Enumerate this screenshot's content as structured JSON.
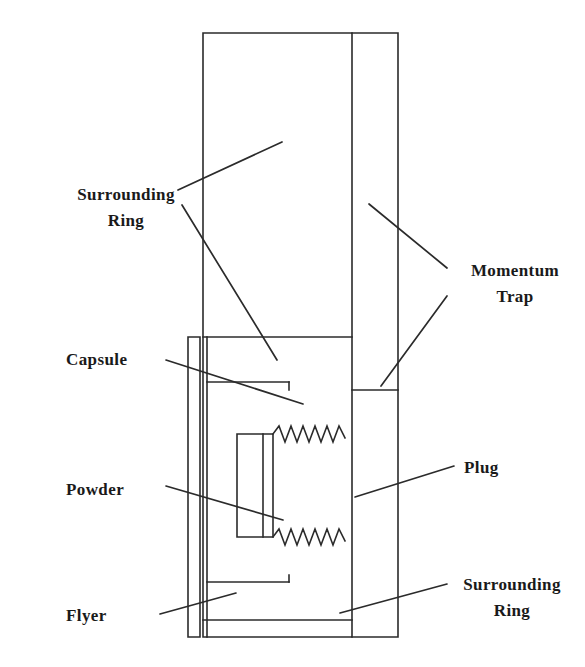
{
  "figure": {
    "background_color": "#ffffff",
    "line_color": "#2b2b2b",
    "text_color": "#1a1a1a",
    "width": 585,
    "height": 667
  },
  "labels": [
    {
      "id": "surrounding-ring-top",
      "line1": "Surrounding",
      "line2": "Ring",
      "x": 68,
      "y": 186
    },
    {
      "id": "momentum-trap",
      "line1": "Momentum",
      "line2": "Trap",
      "x": 455,
      "y": 262
    },
    {
      "id": "capsule",
      "line1": "Capsule",
      "line2": "",
      "x": 68,
      "y": 352
    },
    {
      "id": "powder",
      "line1": "Powder",
      "line2": "",
      "x": 68,
      "y": 482
    },
    {
      "id": "plug",
      "line1": "Plug",
      "line2": "",
      "x": 464,
      "y": 468
    },
    {
      "id": "surrounding-ring-bottom",
      "line1": "Surrounding",
      "line2": "Ring",
      "x": 455,
      "y": 580
    },
    {
      "id": "flyer",
      "line1": "Flyer",
      "line2": "",
      "x": 68,
      "y": 612
    }
  ],
  "parts": [
    {
      "id": "surrounding-ring-body",
      "name": "Surrounding Ring"
    },
    {
      "id": "momentum-trap-body",
      "name": "Momentum Trap"
    },
    {
      "id": "capsule-wall",
      "name": "Capsule"
    },
    {
      "id": "powder-chamber",
      "name": "Powder"
    },
    {
      "id": "plug-threaded",
      "name": "Plug"
    },
    {
      "id": "flyer-plate",
      "name": "Flyer"
    }
  ]
}
